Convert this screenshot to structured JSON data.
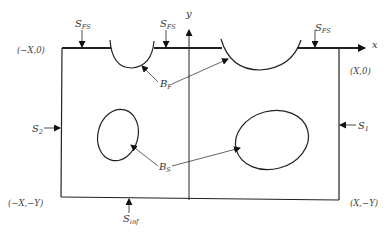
{
  "diagram": {
    "axes": {
      "x_label": "x",
      "y_label": "y"
    },
    "corners": {
      "top_left": "(−X,0)",
      "top_right": "(X,0)",
      "bottom_left": "(−X,−Y)",
      "bottom_right": "(X,−Y)"
    },
    "loads": {
      "sfs_main": "S",
      "sfs_sub": "FS",
      "s1_main": "S",
      "s1_sub": "1",
      "s2_main": "S",
      "s2_sub": "2",
      "sinf_main": "S",
      "sinf_sub": "inf"
    },
    "boundaries": {
      "bf_main": "B",
      "bf_sub": "F",
      "bs_main": "B",
      "bs_sub": "S"
    }
  }
}
